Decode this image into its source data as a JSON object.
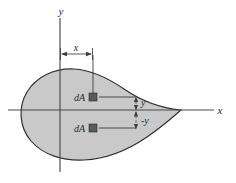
{
  "figure": {
    "background_color": "#ffffff",
    "shape": {
      "name": "teardrop-area",
      "fill_color": "#c9c9c9",
      "outline_color": "#2f2f2f"
    },
    "axes": {
      "x_label": "x",
      "y_label": "y",
      "axis_color": "#4a4a4a"
    },
    "labels": {
      "dimension_x": "x",
      "element_upper": "dA",
      "element_lower": "dA",
      "distance_upper": "y",
      "distance_lower": "-y"
    },
    "elements": {
      "square_color": "#5a5a5a"
    }
  }
}
